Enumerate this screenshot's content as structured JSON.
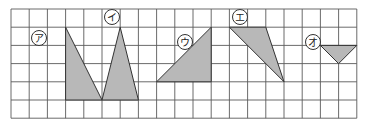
{
  "grid": {
    "origin_x": 11,
    "origin_y": 9,
    "cell": 18.2,
    "cols": 19,
    "rows": 6,
    "line_color": "#5a5a5a"
  },
  "shape_fill": "#b8b8b8",
  "shapes": [
    {
      "id": "a",
      "label": "ア",
      "points": [
        [
          3,
          1
        ],
        [
          3,
          5
        ],
        [
          5,
          5
        ]
      ],
      "label_pos": [
        39,
        38
      ]
    },
    {
      "id": "i",
      "label": "イ",
      "points": [
        [
          6,
          1
        ],
        [
          5,
          5
        ],
        [
          7,
          5
        ]
      ],
      "label_pos": [
        112,
        17
      ]
    },
    {
      "id": "u",
      "label": "ウ",
      "points": [
        [
          8,
          4
        ],
        [
          11,
          1
        ],
        [
          11,
          4
        ]
      ],
      "label_pos": [
        185,
        42
      ]
    },
    {
      "id": "e",
      "label": "エ",
      "points": [
        [
          12,
          1
        ],
        [
          14,
          1
        ],
        [
          15,
          4
        ]
      ],
      "label_pos": [
        240,
        17
      ]
    },
    {
      "id": "o",
      "label": "オ",
      "points": [
        [
          17,
          2
        ],
        [
          19,
          2
        ],
        [
          18,
          3
        ]
      ],
      "label_pos": [
        313,
        42
      ]
    }
  ]
}
